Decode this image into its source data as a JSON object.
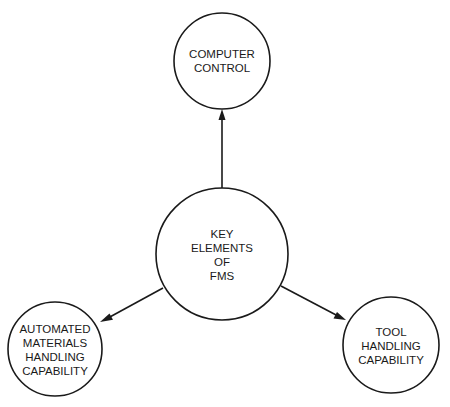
{
  "diagram": {
    "type": "hub-and-spoke",
    "center_node": {
      "id": "key-elements",
      "lines": [
        "KEY",
        "ELEMENTS",
        "OF",
        "FMS"
      ]
    },
    "nodes": [
      {
        "id": "computer-control",
        "lines": [
          "COMPUTER",
          "CONTROL"
        ]
      },
      {
        "id": "materials-handling",
        "lines": [
          "AUTOMATED",
          "MATERIALS",
          "HANDLING",
          "CAPABILITY"
        ]
      },
      {
        "id": "tool-handling",
        "lines": [
          "TOOL",
          "HANDLING",
          "CAPABILITY"
        ]
      }
    ],
    "edges": [
      {
        "from": "key-elements",
        "to": "computer-control",
        "arrow": "end"
      },
      {
        "from": "key-elements",
        "to": "materials-handling",
        "arrow": "end"
      },
      {
        "from": "key-elements",
        "to": "tool-handling",
        "arrow": "end"
      }
    ],
    "colors": {
      "stroke": "#1a1a1a",
      "background": "#ffffff"
    }
  }
}
